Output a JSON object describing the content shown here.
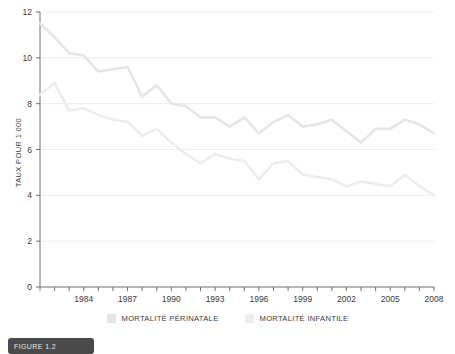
{
  "chart_data": {
    "type": "line",
    "title": "",
    "xlabel": "",
    "ylabel": "TAUX POUR 1 000",
    "xlim": [
      1981,
      2008
    ],
    "ylim": [
      0,
      12
    ],
    "y_ticks": [
      0,
      2,
      4,
      6,
      8,
      10,
      12
    ],
    "x_ticks_labeled": [
      1984,
      1987,
      1990,
      1993,
      1996,
      1999,
      2002,
      2005,
      2008
    ],
    "x": [
      1981,
      1982,
      1983,
      1984,
      1985,
      1986,
      1987,
      1988,
      1989,
      1990,
      1991,
      1992,
      1993,
      1994,
      1995,
      1996,
      1997,
      1998,
      1999,
      2000,
      2001,
      2002,
      2003,
      2004,
      2005,
      2006,
      2007,
      2008
    ],
    "grid": "horizontal",
    "legend_position": "bottom",
    "series": [
      {
        "name": "MORTALITÉ PÉRINATALE",
        "color": "#e6e6e6",
        "values": [
          11.5,
          10.9,
          10.2,
          10.1,
          9.4,
          9.5,
          9.6,
          8.3,
          8.8,
          8.0,
          7.9,
          7.4,
          7.4,
          7.0,
          7.4,
          6.7,
          7.2,
          7.5,
          7.0,
          7.1,
          7.3,
          6.8,
          6.3,
          6.9,
          6.9,
          7.3,
          7.1,
          6.7
        ]
      },
      {
        "name": "MORTALITÉ INFANTILE",
        "color": "#ededed",
        "values": [
          8.4,
          8.9,
          7.7,
          7.8,
          7.5,
          7.3,
          7.2,
          6.6,
          6.9,
          6.3,
          5.8,
          5.4,
          5.8,
          5.6,
          5.5,
          4.7,
          5.4,
          5.5,
          4.9,
          4.8,
          4.7,
          4.4,
          4.6,
          4.5,
          4.4,
          4.9,
          4.4,
          4.0
        ]
      }
    ]
  },
  "legend": {
    "items": [
      {
        "label": "MORTALITÉ PÉRINATALE",
        "color": "#e6e6e6"
      },
      {
        "label": "MORTALITÉ INFANTILE",
        "color": "#ededed"
      }
    ]
  },
  "caption": {
    "text": "FIGURE 1.2"
  },
  "colors": {
    "background": "#ffffff",
    "axis": "#6f6f6f",
    "grid": "#ededed",
    "text": "#3a3a3a"
  }
}
